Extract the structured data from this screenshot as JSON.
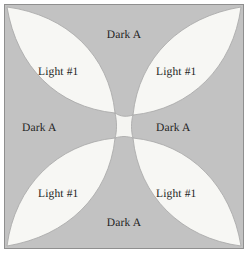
{
  "figure": {
    "kind": "quilt-block-diagram",
    "width": 252,
    "height": 261,
    "frame": {
      "border_color": "#8f8f8f",
      "background_color": "#c2c2c2",
      "page_background": "#ffffff"
    },
    "colors": {
      "dark_fabric": "#c2c2c2",
      "light_fabric": "#f7f7f4",
      "outline": "#9a9a9a",
      "text": "#1d1d1d"
    }
  },
  "patches": {
    "dark": {
      "name": "Dark A",
      "count": 4,
      "labels": {
        "top": "Dark A",
        "right": "Dark A",
        "bottom": "Dark A",
        "left": "Dark A"
      }
    },
    "light": {
      "name": "Light #1",
      "count": 4,
      "labels": {
        "top_left": "Light #1",
        "top_right": "Light #1",
        "bottom_left": "Light #1",
        "bottom_right": "Light #1"
      }
    },
    "center": {
      "name": "center-square",
      "label": ""
    }
  }
}
